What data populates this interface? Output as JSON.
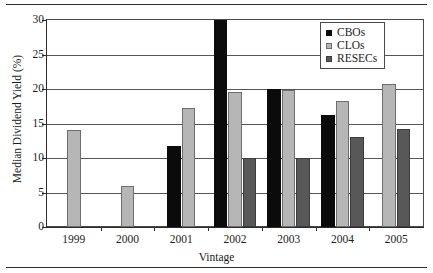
{
  "chart_data": {
    "type": "bar",
    "title": "",
    "xlabel": "Vintage",
    "ylabel": "Median Dividend Yield  (%)",
    "categories": [
      "1999",
      "2000",
      "2001",
      "2002",
      "2003",
      "2004",
      "2005"
    ],
    "ylim": [
      0,
      30
    ],
    "yticks": [
      0,
      5,
      10,
      15,
      20,
      25,
      30
    ],
    "ytick_labels": [
      "0",
      "5",
      "10",
      "15",
      "20",
      "25",
      "30"
    ],
    "grid": true,
    "legend_position": "top-right",
    "series": [
      {
        "name": "CBOs",
        "color": "#0b0b0b",
        "values": [
          null,
          null,
          11.8,
          30.0,
          20.0,
          16.2,
          null
        ]
      },
      {
        "name": "CLOs",
        "color": "#b6b6b6",
        "values": [
          14.0,
          6.0,
          17.2,
          19.5,
          19.9,
          18.2,
          20.7
        ]
      },
      {
        "name": "RESECs",
        "color": "#585858",
        "values": [
          null,
          null,
          null,
          10.0,
          10.0,
          13.0,
          14.2
        ]
      }
    ]
  },
  "legend": {
    "items": [
      {
        "label": "CBOs",
        "swatch": "cbo"
      },
      {
        "label": "CLOs",
        "swatch": "clo"
      },
      {
        "label": "RESECs",
        "swatch": "resec"
      }
    ]
  }
}
